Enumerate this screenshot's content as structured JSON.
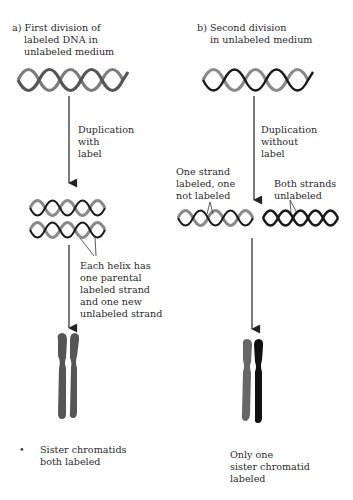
{
  "panel_a": {
    "title_line1": "a) First division of",
    "title_line2": "labeled DNA in",
    "title_line3": "unlabeled medium",
    "step_label_line1": "Duplication",
    "step_label_line2": "with",
    "step_label_line3": "label",
    "helix_note_line1": "Each helix has",
    "helix_note_line2": "one parental",
    "helix_note_line3": "labeled strand",
    "helix_note_line4": "and one new",
    "helix_note_line5": "unlabeled strand",
    "bullet": "•",
    "result_line1": "Sister chromatids",
    "result_line2": "both labeled"
  },
  "panel_b": {
    "title_line1": "b) Second division",
    "title_line2": "in unlabeled medium",
    "step_label_line1": "Duplication",
    "step_label_line2": "without",
    "step_label_line3": "label",
    "left_note_line1": "One strand",
    "left_note_line2": "labeled, one",
    "left_note_line3": "not labeled",
    "right_note_line1": "Both strands",
    "right_note_line2": "unlabeled",
    "result_line1": "Only one",
    "result_line2": "sister chromatid",
    "result_line3": "labeled"
  },
  "colors": {
    "labeled_strand": "#8a8a8a",
    "unlabeled_strand": "#1a1a1a",
    "labeled_chromatid": "#555555",
    "unlabeled_chromatid": "#111111",
    "arrow": "#222222"
  }
}
